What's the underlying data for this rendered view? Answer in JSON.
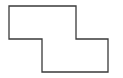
{
  "canvas": {
    "width": 123,
    "height": 78,
    "background": "#ffffff"
  },
  "shape": {
    "type": "polygon",
    "description": "Z-shaped (step) rectilinear outline",
    "points": "9,6 76,6 76,39 108,39 108,72 42,72 42,39 9,39",
    "stroke": "#3a3a3a",
    "stroke_width": 1.3,
    "fill": "none"
  }
}
